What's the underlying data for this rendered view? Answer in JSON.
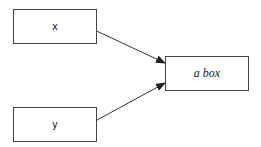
{
  "diagram": {
    "nodes": [
      {
        "id": "x",
        "label": "x"
      },
      {
        "id": "y",
        "label": "y"
      },
      {
        "id": "a_box",
        "label": "a box"
      }
    ],
    "edges": [
      {
        "from": "x",
        "to": "a_box"
      },
      {
        "from": "y",
        "to": "a_box"
      }
    ]
  }
}
